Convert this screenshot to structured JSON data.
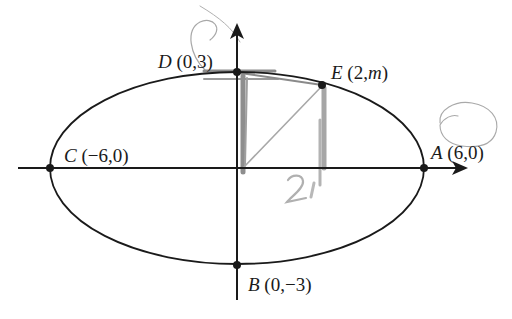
{
  "diagram": {
    "type": "ellipse-on-axes",
    "colors": {
      "ink": "#1a1a1a",
      "pencil": "#8a8a8a",
      "pencil_light": "#b5b5b5"
    },
    "points": {
      "D": {
        "letter": "D",
        "coords": "(0,3)"
      },
      "E": {
        "letter": "E",
        "coords_open": "(2,",
        "coords_var": "m",
        "coords_close": ")"
      },
      "C": {
        "letter": "C",
        "coords": "(−6,0)"
      },
      "A": {
        "letter": "A",
        "coords": "(6,0)"
      },
      "B": {
        "letter": "B",
        "coords": "(0,−3)"
      }
    },
    "handwritten_note": "2"
  }
}
